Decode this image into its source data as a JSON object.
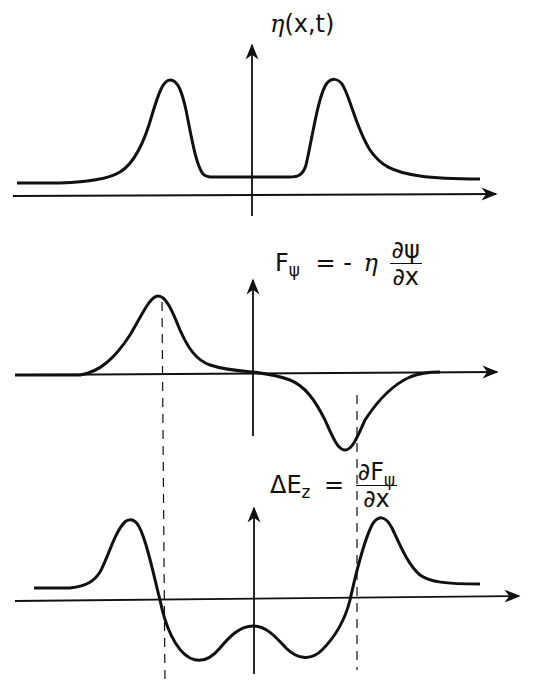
{
  "diagram": {
    "panels": [
      {
        "id": "eta",
        "label": {
          "symbol": "η",
          "args": "(x,t)"
        },
        "description": "Two symmetric positive pulses on an elevated baseline"
      },
      {
        "id": "force",
        "label": {
          "lhs": "F",
          "lhs_sub": "ψ",
          "eq": "= -",
          "eta": "η",
          "num": "∂ψ",
          "den": "∂x"
        },
        "description": "Positive pulse on left, negative pulse on right"
      },
      {
        "id": "energy",
        "label": {
          "lhs": "ΔE",
          "lhs_sub": "z",
          "eq": "=",
          "num_main": "∂F",
          "num_sub": "ψ",
          "den": "∂x"
        },
        "description": "Derivative profile: outer positive peaks, two inner negative troughs with central bump"
      }
    ],
    "colors": {
      "stroke": "#111111",
      "background": "#ffffff"
    }
  }
}
